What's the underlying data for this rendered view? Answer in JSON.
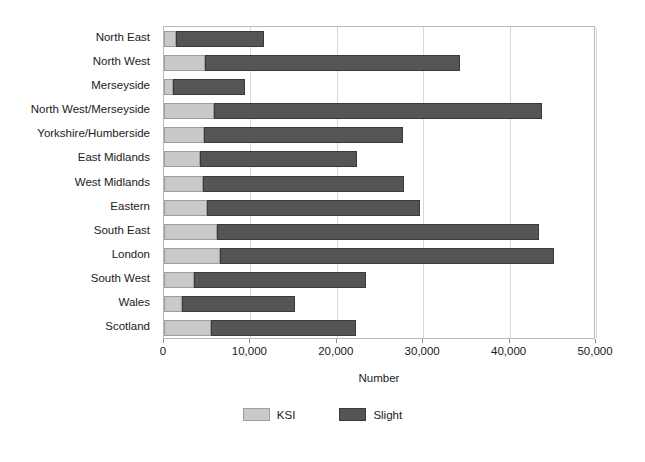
{
  "chart_data": {
    "type": "bar",
    "orientation": "horizontal",
    "stacked": true,
    "title": "",
    "xlabel": "Number",
    "ylabel": "",
    "xlim": [
      0,
      50000
    ],
    "xticks": [
      0,
      10000,
      20000,
      30000,
      40000,
      50000
    ],
    "xticklabels": [
      "0",
      "10,000",
      "20,000",
      "30,000",
      "40,000",
      "50,000"
    ],
    "grid": "vertical",
    "legend_position": "bottom-center",
    "categories": [
      "North East",
      "North West",
      "Merseyside",
      "North West/Merseyside",
      "Yorkshire/Humberside",
      "East Midlands",
      "West Midlands",
      "Eastern",
      "South East",
      "London",
      "South West",
      "Wales",
      "Scotland"
    ],
    "series": [
      {
        "name": "KSI",
        "color": "#c9c9c9",
        "values": [
          1400,
          4700,
          1000,
          5800,
          4600,
          4200,
          4500,
          5000,
          6100,
          6500,
          3500,
          2100,
          5400
        ]
      },
      {
        "name": "Slight",
        "color": "#555555",
        "values": [
          10200,
          29600,
          8400,
          38000,
          23100,
          18100,
          23300,
          24600,
          37300,
          38600,
          19900,
          13100,
          16800
        ]
      }
    ],
    "totals": [
      11600,
      34300,
      9400,
      43800,
      27700,
      22300,
      27800,
      29600,
      43400,
      45100,
      23400,
      15200,
      22200
    ]
  },
  "legend": {
    "items": [
      {
        "label": "KSI",
        "swatch": "ksi"
      },
      {
        "label": "Slight",
        "swatch": "slight"
      }
    ]
  },
  "axis": {
    "x_title": "Number"
  }
}
